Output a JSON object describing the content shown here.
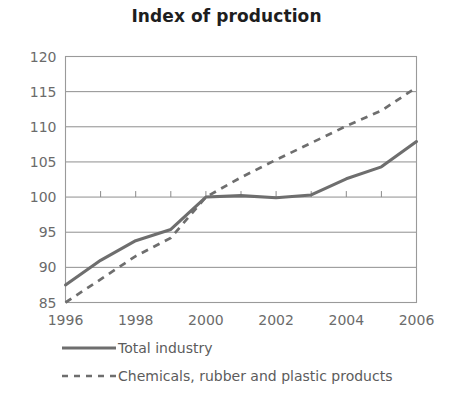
{
  "chart_data": {
    "type": "line",
    "title": "Index of production",
    "xlabel": "",
    "ylabel": "",
    "xlim": [
      1996,
      2006
    ],
    "ylim": [
      85,
      120
    ],
    "ytick_labels": [
      "85",
      "90",
      "95",
      "100",
      "105",
      "110",
      "115",
      "120"
    ],
    "yticks": [
      85,
      90,
      95,
      100,
      105,
      110,
      115,
      120
    ],
    "xtick_labels": [
      "1996",
      "1998",
      "2000",
      "2002",
      "2004",
      "2006"
    ],
    "xticks": [
      1996,
      1998,
      2000,
      2002,
      2004,
      2006
    ],
    "x": [
      1996,
      1997,
      1998,
      1999,
      2000,
      2001,
      2002,
      2003,
      2004,
      2005,
      2006
    ],
    "grid": true,
    "legend_position": "bottom-left",
    "series": [
      {
        "name": "Total industry",
        "style": "solid",
        "color": "#6e6e6e",
        "values": [
          87.5,
          91.0,
          93.8,
          95.4,
          100.0,
          100.2,
          99.9,
          100.3,
          102.6,
          104.3,
          107.9
        ]
      },
      {
        "name": "Chemicals, rubber and plastic products",
        "style": "dashed",
        "color": "#6e6e6e",
        "values": [
          85.0,
          88.3,
          91.6,
          94.2,
          100.0,
          102.8,
          105.3,
          107.7,
          110.1,
          112.3,
          115.6
        ]
      }
    ]
  },
  "legend": {
    "items": [
      {
        "label": "Total industry",
        "style": "solid"
      },
      {
        "label": "Chemicals, rubber and plastic products",
        "style": "dashed"
      }
    ]
  }
}
